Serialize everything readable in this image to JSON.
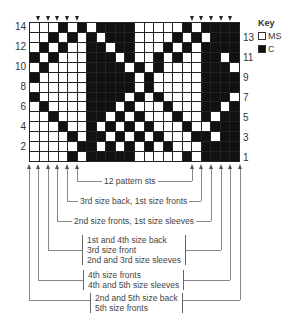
{
  "chart": {
    "columns": 22,
    "rows": 14,
    "grid": [
      "0001010111100000101111",
      "0010101011100001010111",
      "0101001101100010101111",
      "1010001110100101001101",
      "0100001111010100001110",
      "1000001111101000001111",
      "0000001111101000001111",
      "1000001111010100001110",
      "0100001110100010001101",
      "0010001101010001001011",
      "0001001010101000100111",
      "0000101101010100011011",
      "0000011010101010001111",
      "0000101111100000101111"
    ],
    "left_row_labels": [
      "14",
      "12",
      "10",
      "8",
      "6",
      "4",
      "2"
    ],
    "right_row_labels": [
      "13",
      "11",
      "9",
      "7",
      "5",
      "3",
      "1"
    ]
  },
  "key": {
    "title": "Key",
    "items": [
      {
        "swatch": "ms",
        "label": "MS"
      },
      {
        "swatch": "c",
        "label": "C"
      }
    ]
  },
  "brackets": {
    "b1": "12 pattern sts",
    "b2": "3rd size back, 1st size fronts",
    "b3": "2nd size fronts, 1st size sleeves",
    "b4": [
      "1st and 4th size back",
      "3rd size front",
      "2nd and 3rd size sleeves"
    ],
    "b5": [
      "4th size fronts",
      "4th and 5th size sleeves"
    ],
    "b6": [
      "2nd and 5th size back",
      "5th size fronts"
    ]
  },
  "colors": {
    "main_shade": "#ffffff",
    "contrast": "#111111"
  }
}
